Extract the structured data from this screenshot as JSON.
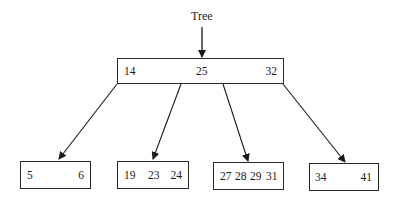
{
  "diagram": {
    "type": "B-tree",
    "pointer_label": "Tree",
    "root": {
      "keys": [
        "14",
        "25",
        "32"
      ]
    },
    "leaves": [
      {
        "keys": [
          "5",
          "6"
        ]
      },
      {
        "keys": [
          "19",
          "23",
          "24"
        ]
      },
      {
        "keys": [
          "27",
          "28",
          "29",
          "31"
        ]
      },
      {
        "keys": [
          "34",
          "41"
        ]
      }
    ]
  }
}
